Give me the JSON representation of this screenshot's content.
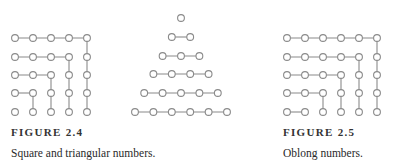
{
  "figures": [
    {
      "id": "figure-2-4",
      "label": "FIGURE 2.4",
      "caption": "Square and triangular numbers.",
      "diagrams": [
        "square-numbers",
        "triangular-numbers"
      ]
    },
    {
      "id": "figure-2-5",
      "label": "FIGURE 2.5",
      "caption": "Oblong numbers.",
      "diagrams": [
        "oblong-numbers"
      ]
    }
  ],
  "diagrams": {
    "square-numbers": {
      "description": "5x5 grid of dots; nested L-shaped gnomons connect dots showing 1, 4, 9, 16, 25",
      "cols_x": [
        15,
        33,
        51,
        69,
        87
      ],
      "rows_y": [
        38,
        57,
        75,
        93,
        112
      ],
      "gnomon_count": 5
    },
    "triangular-numbers": {
      "description": "Triangle of dots with rows of 1 to 6 dots, each row connected horizontally",
      "rows": [
        {
          "y": 18,
          "count": 1
        },
        {
          "y": 37,
          "count": 2
        },
        {
          "y": 56,
          "count": 3
        },
        {
          "y": 74,
          "count": 4
        },
        {
          "y": 93,
          "count": 5
        },
        {
          "y": 112,
          "count": 6
        }
      ],
      "center_x": 181,
      "spacing": 18.4
    },
    "oblong-numbers": {
      "description": "5 rows x 6 columns of dots; nested L-shaped gnomons showing 2, 6, 12, 20, 30",
      "cols_x": [
        287,
        305,
        323,
        341,
        359,
        377
      ],
      "rows_y": [
        38,
        57,
        75,
        93,
        112
      ],
      "gnomon_count": 5
    }
  },
  "colors": {
    "stroke": "#8a8a8a",
    "text": "#2a2a2a"
  }
}
